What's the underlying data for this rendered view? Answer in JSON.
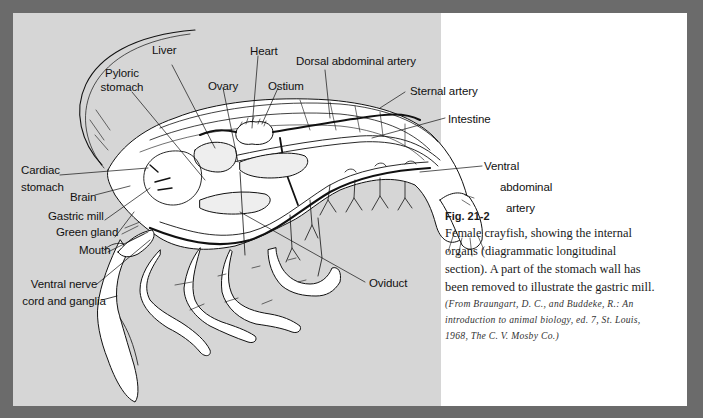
{
  "figure": {
    "number": "Fig. 21-2",
    "caption": "Female crayfish, showing the internal organs (diagrammatic longitudinal section). A part of the stomach wall has been removed to illustrate the gastric mill.",
    "caption_lines": [
      "Female crayfish, showing the internal",
      "organs (diagrammatic longitudinal",
      "section). A part of the stomach wall has",
      "been removed to illustrate the gastric mill."
    ],
    "source_lines": [
      "(From Braungart, D. C., and Buddeke, R.: An",
      "introduction to animal biology, ed. 7, St. Louis,",
      "1968, The C. V. Mosby Co.)"
    ]
  },
  "labels": {
    "liver": "Liver",
    "heart": "Heart",
    "dorsal_abdominal_artery": "Dorsal abdominal artery",
    "pyloric_stomach_1": "Pyloric",
    "pyloric_stomach_2": "stomach",
    "ovary": "Ovary",
    "ostium": "Ostium",
    "sternal_artery": "Sternal artery",
    "intestine": "Intestine",
    "cardiac_stomach_1": "Cardiac",
    "cardiac_stomach_2": "stomach",
    "brain": "Brain",
    "gastric_mill": "Gastric mill",
    "green_gland": "Green gland",
    "mouth": "Mouth",
    "ventral_nerve_1": "Ventral nerve",
    "ventral_nerve_2": "cord and ganglia",
    "ventral_abdominal_artery_1": "Ventral",
    "ventral_abdominal_artery_2": "abdominal",
    "ventral_abdominal_artery_3": "artery",
    "oviduct": "Oviduct"
  },
  "colors": {
    "border": "#6b6b6b",
    "figure_background": "#d6d6d6",
    "page_background": "#ffffff",
    "ink": "#111111"
  }
}
